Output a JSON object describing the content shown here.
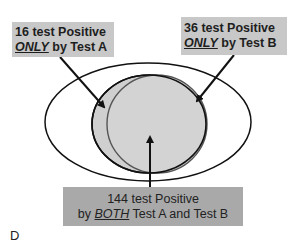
{
  "diagram": {
    "panel_label": "D",
    "outer_region_label": "",
    "test_a_only": {
      "count": "16",
      "line1": "16 test Positive",
      "emphasis": "ONLY",
      "line2_rest": " by Test A"
    },
    "test_b_only": {
      "count": "36",
      "line1": "36 test Positive",
      "emphasis": "ONLY",
      "line2_rest": " by Test B"
    },
    "both": {
      "count": "144",
      "line1": "144 test Positive",
      "line2_prefix": "by ",
      "emphasis": "BOTH",
      "line2_rest": " Test A and Test B"
    },
    "colors": {
      "circle_fill": "#cfcfcf",
      "box_fill": "#c8c8c8",
      "both_box_fill": "#a9a9a9",
      "stroke": "#111111",
      "circle_b_stroke": "#555555"
    }
  }
}
